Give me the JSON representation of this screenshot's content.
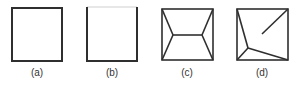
{
  "figure": {
    "stroke_color": "#2f2f2f",
    "light_stroke_color": "#cfcfcf",
    "panels": [
      {
        "label": "(a)",
        "description": "empty square",
        "box": [
          12,
          8,
          62,
          61
        ]
      },
      {
        "label": "(b)",
        "description": "square with faint top edge",
        "box": [
          87,
          7,
          137,
          61
        ]
      },
      {
        "label": "(c)",
        "description": "square with two interior nodes joined by a horizontal segment, each linked to the two adjacent corners",
        "box": [
          162,
          9,
          213,
          60
        ],
        "nodes": [
          [
            173,
            35
          ],
          [
            202,
            35
          ]
        ]
      },
      {
        "label": "(d)",
        "description": "square with one interior node linked to top-left, bottom-left and bottom-right corners, plus a dangling segment from the top-right corner",
        "box": [
          237,
          9,
          288,
          60
        ],
        "nodes": [
          [
            248,
            48
          ]
        ],
        "dangling_segment": [
          [
            288,
            9
          ],
          [
            262,
            34
          ]
        ]
      }
    ]
  }
}
